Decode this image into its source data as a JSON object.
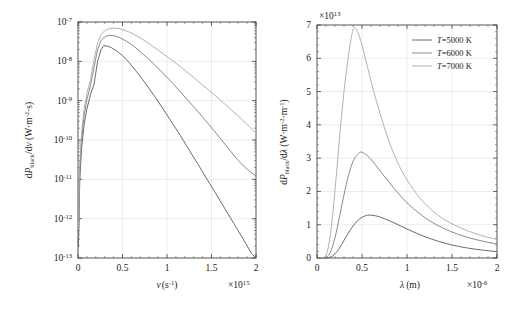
{
  "figure": {
    "background": "#ffffff",
    "panels": [
      "frequency-spectrum",
      "wavelength-spectrum"
    ]
  },
  "colors": {
    "curve_5000": "#5a5a5a",
    "curve_6000": "#7d7d7d",
    "curve_7000": "#a8a8a8",
    "axis": "#2b2b2b",
    "grid": "#d8d8d8"
  },
  "legend": {
    "position": "top-right",
    "entries": [
      {
        "label": "T=5000 K",
        "temperature": 5000,
        "color": "#5a5a5a"
      },
      {
        "label": "T=6000 K",
        "temperature": 6000,
        "color": "#7d7d7d"
      },
      {
        "label": "T=7000 K",
        "temperature": 7000,
        "color": "#a8a8a8"
      }
    ]
  },
  "chart_data": [
    {
      "id": "frequency-spectrum",
      "type": "line",
      "title": "",
      "xlabel": "ν (s⁻¹)",
      "xlabel_symbol": "ν",
      "xlabel_units": "(s⁻¹)",
      "ylabel": "dP_black/dν (W·m⁻²·s)",
      "ylabel_parts": {
        "d": "d",
        "P": "P",
        "sub": "black",
        "over": "/dν",
        "units": "(W·m⁻²·s)"
      },
      "xscale": "linear",
      "yscale": "log",
      "xlim": [
        0,
        2
      ],
      "ylim": [
        1e-13,
        1e-07
      ],
      "x_multiplier": "×10¹⁵",
      "x_multiplier_base": "×10",
      "x_multiplier_exp": "15",
      "y_multiplier": "",
      "xticks": [
        0,
        0.5,
        1,
        1.5,
        2
      ],
      "xticklabels": [
        "0",
        "0.5",
        "1",
        "1.5",
        "2"
      ],
      "yticks": [
        1e-07,
        1e-08,
        1e-09,
        1e-10,
        1e-11,
        1e-12,
        1e-13
      ],
      "yticklabels": [
        "10⁻⁷",
        "10⁻⁸",
        "10⁻⁹",
        "10⁻¹⁰",
        "10⁻¹¹",
        "10⁻¹²",
        "10⁻¹³"
      ],
      "ytick_exps": [
        "-7",
        "-8",
        "-9",
        "-10",
        "-11",
        "-12",
        "-13"
      ],
      "grid": true,
      "series": [
        {
          "name": "T=5000 K",
          "color": "#5a5a5a",
          "peak_x": 0.29,
          "peak_y": 2.5e-08,
          "end_y": 7e-13,
          "x": [
            0.005,
            0.02,
            0.04,
            0.07,
            0.1,
            0.14,
            0.18,
            0.22,
            0.26,
            0.29,
            0.33,
            0.38,
            0.44,
            0.5,
            0.58,
            0.66,
            0.75,
            0.85,
            0.95,
            1.05,
            1.15,
            1.25,
            1.35,
            1.45,
            1.55,
            1.65,
            1.75,
            1.85,
            1.95,
            2.0
          ],
          "y": [
            2e-13,
            9.5e-12,
            6e-11,
            2.6e-10,
            6.2e-10,
            1.4e-09,
            2.6e-09,
            1e-08,
            2e-08,
            2.5e-08,
            2.45e-08,
            2.2e-08,
            1.8e-08,
            1.4e-08,
            9e-09,
            5.4e-09,
            2.9e-09,
            1.4e-09,
            6.5e-10,
            2.9e-10,
            1.3e-10,
            5.5e-11,
            2.4e-11,
            1e-11,
            4.3e-12,
            1.8e-12,
            7.6e-13,
            3.2e-13,
            1.3e-13,
            9e-14
          ]
        },
        {
          "name": "T=6000 K",
          "color": "#7d7d7d",
          "peak_x": 0.35,
          "peak_y": 4.6e-08,
          "end_y": 1.2e-11,
          "x": [
            0.005,
            0.02,
            0.04,
            0.07,
            0.1,
            0.14,
            0.18,
            0.22,
            0.26,
            0.3,
            0.35,
            0.4,
            0.46,
            0.54,
            0.62,
            0.72,
            0.82,
            0.92,
            1.05,
            1.18,
            1.3,
            1.42,
            1.55,
            1.68,
            1.8,
            1.9,
            2.0
          ],
          "y": [
            3.5e-13,
            1.6e-11,
            1e-10,
            4.4e-10,
            1.05e-09,
            2.4e-09,
            7e-09,
            2e-08,
            3.4e-08,
            4.2e-08,
            4.6e-08,
            4.5e-08,
            4.1e-08,
            3.3e-08,
            2.5e-08,
            1.6e-08,
            1e-08,
            6e-09,
            3e-09,
            1.4e-09,
            7e-10,
            3.4e-10,
            1.5e-10,
            6.5e-11,
            3e-11,
            1.8e-11,
            1.2e-11
          ]
        },
        {
          "name": "T=7000 K",
          "color": "#a8a8a8",
          "peak_x": 0.4,
          "peak_y": 7e-08,
          "end_y": 1.5e-10,
          "x": [
            0.005,
            0.02,
            0.04,
            0.07,
            0.1,
            0.14,
            0.18,
            0.22,
            0.26,
            0.3,
            0.35,
            0.4,
            0.46,
            0.54,
            0.62,
            0.72,
            0.82,
            0.95,
            1.1,
            1.25,
            1.4,
            1.55,
            1.7,
            1.85,
            2.0
          ],
          "y": [
            5.5e-13,
            2.5e-11,
            1.5e-10,
            6.5e-10,
            1.5e-09,
            3.4e-09,
            1.1e-08,
            2.9e-08,
            4.8e-08,
            6e-08,
            6.8e-08,
            7e-08,
            6.8e-08,
            6e-08,
            5e-08,
            3.7e-08,
            2.6e-08,
            1.6e-08,
            9e-09,
            4.8e-09,
            2.5e-09,
            1.3e-09,
            6.5e-10,
            3.2e-10,
            1.5e-10
          ]
        }
      ]
    },
    {
      "id": "wavelength-spectrum",
      "type": "line",
      "title": "",
      "xlabel": "λ (m)",
      "xlabel_symbol": "λ",
      "xlabel_units": "(m)",
      "ylabel": "dP_black/dλ (W·m⁻²·m⁻¹)",
      "ylabel_parts": {
        "d": "d",
        "P": "P",
        "sub": "black",
        "over": "/dλ",
        "units": "(W·m⁻²·m⁻¹)"
      },
      "xscale": "linear",
      "yscale": "linear",
      "xlim": [
        0,
        2
      ],
      "ylim": [
        0,
        7
      ],
      "x_multiplier": "×10⁻⁶",
      "x_multiplier_base": "×10",
      "x_multiplier_exp": "-6",
      "y_multiplier": "×10¹³",
      "y_multiplier_base": "×10",
      "y_multiplier_exp": "13",
      "xticks": [
        0,
        0.5,
        1,
        1.5,
        2
      ],
      "xticklabels": [
        "0",
        "0.5",
        "1",
        "1.5",
        "2"
      ],
      "yticks": [
        0,
        1,
        2,
        3,
        4,
        5,
        6,
        7
      ],
      "yticklabels": [
        "0",
        "1",
        "2",
        "3",
        "4",
        "5",
        "6",
        "7"
      ],
      "grid": true,
      "series": [
        {
          "name": "T=5000 K",
          "color": "#5a5a5a",
          "peak_x": 0.58,
          "peak_y": 1.29,
          "x": [
            0.05,
            0.1,
            0.15,
            0.2,
            0.25,
            0.3,
            0.35,
            0.4,
            0.45,
            0.5,
            0.55,
            0.58,
            0.62,
            0.68,
            0.75,
            0.82,
            0.9,
            1.0,
            1.1,
            1.2,
            1.35,
            1.5,
            1.65,
            1.8,
            2.0
          ],
          "y": [
            0.0,
            0.002,
            0.03,
            0.12,
            0.3,
            0.53,
            0.76,
            0.96,
            1.12,
            1.22,
            1.28,
            1.29,
            1.28,
            1.25,
            1.18,
            1.1,
            1.0,
            0.87,
            0.75,
            0.64,
            0.5,
            0.39,
            0.31,
            0.25,
            0.19
          ]
        },
        {
          "name": "T=6000 K",
          "color": "#7d7d7d",
          "peak_x": 0.48,
          "peak_y": 3.18,
          "x": [
            0.05,
            0.1,
            0.15,
            0.2,
            0.25,
            0.3,
            0.35,
            0.4,
            0.44,
            0.48,
            0.52,
            0.58,
            0.65,
            0.72,
            0.8,
            0.9,
            1.0,
            1.1,
            1.25,
            1.4,
            1.55,
            1.7,
            1.85,
            2.0
          ],
          "y": [
            0.0,
            0.02,
            0.18,
            0.61,
            1.24,
            1.9,
            2.48,
            2.9,
            3.08,
            3.18,
            3.15,
            3.02,
            2.8,
            2.55,
            2.28,
            1.95,
            1.66,
            1.42,
            1.12,
            0.9,
            0.73,
            0.6,
            0.5,
            0.42
          ]
        },
        {
          "name": "T=7000 K",
          "color": "#a8a8a8",
          "peak_x": 0.41,
          "peak_y": 6.92,
          "x": [
            0.05,
            0.1,
            0.14,
            0.18,
            0.22,
            0.26,
            0.3,
            0.34,
            0.38,
            0.41,
            0.45,
            0.5,
            0.56,
            0.63,
            0.7,
            0.8,
            0.9,
            1.0,
            1.15,
            1.3,
            1.45,
            1.6,
            1.75,
            1.9,
            2.0
          ],
          "y": [
            0.0,
            0.09,
            0.55,
            1.45,
            2.65,
            3.9,
            5.0,
            5.9,
            6.6,
            6.92,
            6.8,
            6.4,
            5.75,
            5.0,
            4.35,
            3.5,
            2.85,
            2.35,
            1.78,
            1.38,
            1.1,
            0.9,
            0.74,
            0.62,
            0.56
          ]
        }
      ]
    }
  ]
}
